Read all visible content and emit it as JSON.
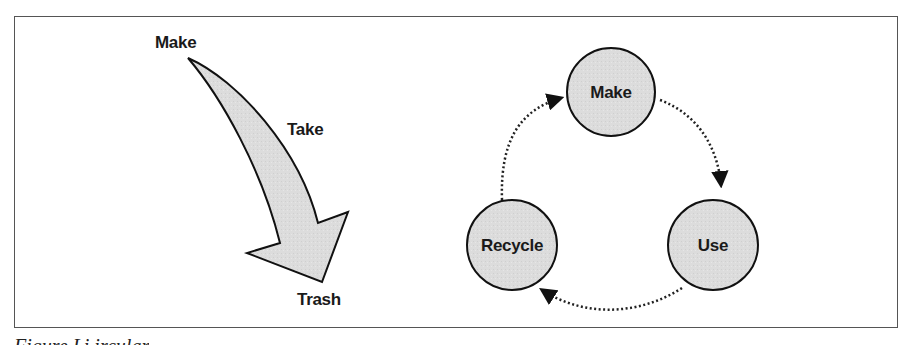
{
  "linear": {
    "start_label": "Make",
    "middle_label": "Take",
    "end_label": "Trash"
  },
  "circular": {
    "nodes": [
      {
        "label": "Make"
      },
      {
        "label": "Use"
      },
      {
        "label": "Recycle"
      }
    ]
  },
  "caption": "Figure     Li                                   ircular       "
}
